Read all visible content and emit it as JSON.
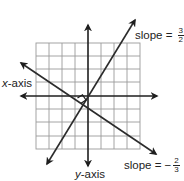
{
  "diagram": {
    "type": "coordinate-plane-perpendicular-lines",
    "x_axis_label": {
      "var": "x",
      "suffix": "-axis"
    },
    "y_axis_label": {
      "var": "y",
      "suffix": "-axis"
    },
    "line1": {
      "label": "slope = ",
      "sign": "",
      "num": "3",
      "den": "2",
      "slope": 1.5
    },
    "line2": {
      "label": "slope = ",
      "sign": "−",
      "num": "2",
      "den": "3",
      "slope": -0.6667
    },
    "grid": {
      "cols": 8,
      "rows": 8
    },
    "right_angle_marker": true,
    "colors": {
      "lines": "#2b2b2b",
      "grid": "#9a9a9a",
      "text": "#222222"
    }
  }
}
